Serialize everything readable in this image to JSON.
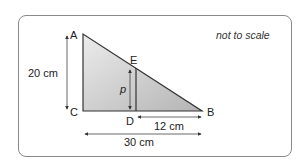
{
  "diagram": {
    "note": "not to scale",
    "vertices": {
      "A": "A",
      "B": "B",
      "C": "C",
      "D": "D",
      "E": "E"
    },
    "labels": {
      "height_AC": "20 cm",
      "length_DB": "12 cm",
      "length_CB": "30 cm",
      "segment_DE": "p"
    },
    "colors": {
      "triangle_fill_light": "#e8e8e8",
      "triangle_fill_dark": "#b8b8b8",
      "stroke": "#333333",
      "frame": "#8a8a8a"
    }
  }
}
